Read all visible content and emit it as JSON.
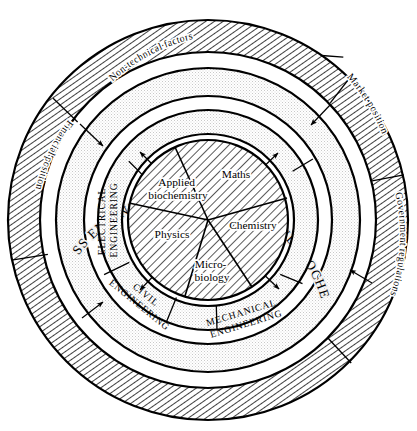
{
  "diagram": {
    "center": {
      "x": 208,
      "y": 220
    },
    "colors": {
      "stroke": "#000000",
      "background": "#ffffff",
      "ring_fill_light": "#f2f2f2",
      "hatch": "#000000"
    },
    "rings": [
      {
        "id": "outer-ring",
        "name": "non-technical-context-ring",
        "style": "diagonal-hatch",
        "inner_radius": 168,
        "outer_radius": 200,
        "segments": [
          {
            "id": "non-technical-factors",
            "label": "Non-technical factors"
          },
          {
            "id": "market-position",
            "label": "Market position"
          },
          {
            "id": "government-regulations",
            "label": "Government regulations"
          },
          {
            "id": "financial-position",
            "label": "Financial position"
          }
        ]
      },
      {
        "id": "process-ring",
        "name": "process-engineering-ring",
        "style": "stipple",
        "inner_radius": 124,
        "outer_radius": 152,
        "segments": [
          {
            "id": "process-engineering",
            "label": "PROCESS ENGINEERING (CHEMICAL AND BIOCHEMICAL)"
          }
        ]
      },
      {
        "id": "engineering-ring",
        "name": "supporting-engineering-ring",
        "style": "stipple",
        "inner_radius": 86,
        "outer_radius": 110,
        "segments": [
          {
            "id": "electrical-engineering",
            "label_lines": [
              "ELECTRICAL",
              "ENGINEERING"
            ]
          },
          {
            "id": "civil-engineering",
            "label_lines": [
              "CIVIL",
              "ENGINEERING"
            ]
          },
          {
            "id": "mechanical-engineering",
            "label_lines": [
              "MECHANICAL",
              "ENGINEERING"
            ]
          }
        ]
      },
      {
        "id": "core-circle",
        "name": "basic-sciences-core",
        "style": "diagonal-hatch",
        "inner_radius": 0,
        "outer_radius": 80,
        "segments": [
          {
            "id": "maths",
            "label_lines": [
              "Maths"
            ]
          },
          {
            "id": "chemistry",
            "label_lines": [
              "Chemistry"
            ]
          },
          {
            "id": "microbiology",
            "label_lines": [
              "Micro-",
              "biology"
            ]
          },
          {
            "id": "physics",
            "label_lines": [
              "Physics"
            ]
          },
          {
            "id": "applied-biochemistry",
            "label_lines": [
              "Applied",
              "biochemistry"
            ]
          }
        ]
      }
    ]
  },
  "labels": {
    "non_technical_factors": "Non-technical factors",
    "market_position": "Market position",
    "government_regulations": "Government regulations",
    "financial_position": "Financial position",
    "process_engineering": "PROCESS ENGINEERING (CHEMICAL AND BIOCHEMICAL)",
    "electrical_line1": "ELECTRICAL",
    "electrical_line2": "ENGINEERING",
    "civil_line1": "CIVIL",
    "civil_line2": "ENGINEERING",
    "mechanical_line1": "MECHANICAL",
    "mechanical_line2": "ENGINEERING",
    "maths": "Maths",
    "chemistry": "Chemistry",
    "microbiology_line1": "Micro-",
    "microbiology_line2": "biology",
    "physics": "Physics",
    "applied_line1": "Applied",
    "applied_line2": "biochemistry"
  }
}
